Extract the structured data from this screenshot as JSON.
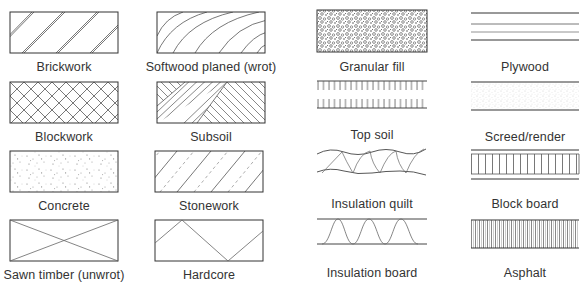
{
  "legend": {
    "columns": [
      {
        "items": [
          {
            "id": "brickwork",
            "label": "Brickwork",
            "pattern": "double-diagonal-hatch"
          },
          {
            "id": "blockwork",
            "label": "Blockwork",
            "pattern": "cross-hatch"
          },
          {
            "id": "concrete",
            "label": "Concrete",
            "pattern": "stipple-aggregate"
          },
          {
            "id": "sawn-timber",
            "label": "Sawn timber (unwrot)",
            "pattern": "diagonal-cross"
          }
        ]
      },
      {
        "items": [
          {
            "id": "softwood-planed",
            "label": "Softwood planed (wrot)",
            "pattern": "curved-grain"
          },
          {
            "id": "subsoil",
            "label": "Subsoil",
            "pattern": "alternating-diagonal-blocks"
          },
          {
            "id": "stonework",
            "label": "Stonework",
            "pattern": "diagonal-solid-dashed"
          },
          {
            "id": "hardcore",
            "label": "Hardcore",
            "pattern": "zigzag"
          }
        ]
      },
      {
        "items": [
          {
            "id": "granular-fill",
            "label": "Granular fill",
            "pattern": "dense-circles"
          },
          {
            "id": "top-soil",
            "label": "Top soil",
            "pattern": "comb-lines"
          },
          {
            "id": "insulation-quilt",
            "label": "Insulation quilt",
            "pattern": "wavy-zigzag"
          },
          {
            "id": "insulation-board",
            "label": "Insulation board",
            "pattern": "bell-curves"
          }
        ]
      },
      {
        "items": [
          {
            "id": "plywood",
            "label": "Plywood",
            "pattern": "parallel-lines"
          },
          {
            "id": "screed-render",
            "label": "Screed/render",
            "pattern": "fine-stipple"
          },
          {
            "id": "block-board",
            "label": "Block board",
            "pattern": "vertical-strips"
          },
          {
            "id": "asphalt",
            "label": "Asphalt",
            "pattern": "dense-vertical-lines"
          }
        ]
      }
    ]
  },
  "colors": {
    "stroke": "#333333",
    "light_stroke": "#7a7a7a",
    "background": "#ffffff"
  }
}
